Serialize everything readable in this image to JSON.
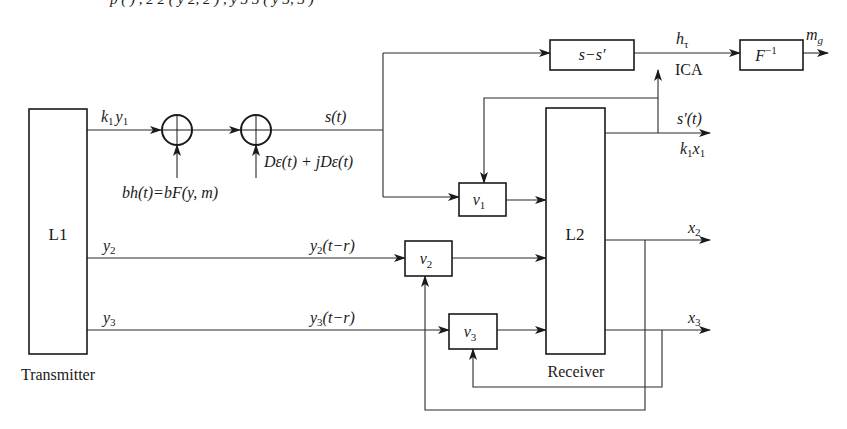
{
  "diagram": {
    "top_formula_fragment": "p  (   ) ,  2    2 ( y 2,    2 ) ,  y 3    3 ( y 3,    3 )",
    "transmitter": {
      "block": "L1",
      "caption": "Transmitter"
    },
    "receiver": {
      "block": "L2",
      "caption": "Receiver"
    },
    "signals": {
      "k1y1": {
        "base": "k",
        "sub1": "1",
        "base2": "y",
        "sub2": "1"
      },
      "noise_bh": "bh(t)=bF(y, m)",
      "noise_d": "Dε(t) + jDε(t)",
      "s_t": "s(t)",
      "y2": {
        "base": "y",
        "sub": "2"
      },
      "y3": {
        "base": "y",
        "sub": "3"
      },
      "y2_delay": {
        "base": "y",
        "sub": "2",
        "rest": "(t−r)"
      },
      "y3_delay": {
        "base": "y",
        "sub": "3",
        "rest": "(t−r)"
      },
      "s_prime": "s′(t)",
      "k1x1": {
        "base": "k",
        "sub1": "1",
        "base2": "x",
        "sub2": "1"
      },
      "x2": {
        "base": "x",
        "sub": "2"
      },
      "x3": {
        "base": "x",
        "sub": "3"
      },
      "h_tau": {
        "base": "h",
        "sub": "τ"
      },
      "ica": "ICA",
      "m_g": {
        "base": "m",
        "sub": "g"
      }
    },
    "blocks": {
      "subtract": "s−s′",
      "inverse": {
        "base": "F",
        "sup": "−1"
      },
      "v1": {
        "base": "v",
        "sub": "1"
      },
      "v2": {
        "base": "v",
        "sub": "2"
      },
      "v3": {
        "base": "v",
        "sub": "3"
      }
    },
    "colors": {
      "line": "#2a2a2a",
      "text": "#1a1a1a",
      "background": "#ffffff"
    }
  }
}
